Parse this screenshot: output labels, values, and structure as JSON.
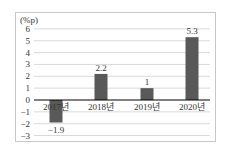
{
  "chart_data": {
    "type": "bar",
    "title": "",
    "unit_label": "(%p)",
    "xlabel": "",
    "ylabel": "(%p)",
    "categories": [
      "2017년",
      "2018년",
      "2019년",
      "2020년"
    ],
    "values": [
      -1.9,
      2.2,
      1,
      5.3
    ],
    "value_labels": [
      "−1.9",
      "2.2",
      "1",
      "5.3"
    ],
    "yticks": [
      6,
      5,
      4,
      3,
      2,
      1,
      0,
      -1,
      -2,
      -3
    ],
    "ytick_labels": [
      "6",
      "5",
      "4",
      "3",
      "2",
      "1",
      "0",
      "−1",
      "−2",
      "−3"
    ],
    "ylim": [
      -3,
      6
    ],
    "grid": true,
    "legend": null,
    "bar_color": "#595959",
    "grid_color": "#d9d9d9",
    "axis_color": "#000000"
  }
}
